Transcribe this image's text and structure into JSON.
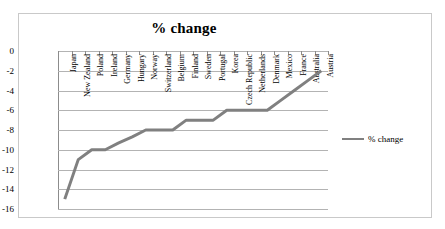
{
  "chart_data": {
    "type": "line",
    "title": "% change",
    "xlabel": "",
    "ylabel": "",
    "ylim": [
      -16,
      0
    ],
    "yticks": [
      0,
      -2,
      -4,
      -6,
      -8,
      -10,
      -12,
      -14,
      -16
    ],
    "ytick_labels": [
      "0",
      "-2",
      "-4",
      "-6",
      "-8",
      "-10",
      "-12",
      "-14",
      "-16"
    ],
    "grid": true,
    "legend_position": "right",
    "series_name": "% change",
    "series_color": "#808080",
    "categories": [
      "Japan",
      "New Zealand",
      "Poland",
      "Ireland",
      "Germany",
      "Hungary",
      "Norway",
      "Switzerland",
      "Belgium",
      "Finland",
      "Sweden",
      "Portugal",
      "Korea",
      "Czech Republic",
      "Netherlands",
      "Denmark",
      "Mexico",
      "France",
      "Australia",
      "Austria"
    ],
    "values": [
      -15.0,
      -11.0,
      -10.0,
      -10.0,
      -9.3,
      -8.7,
      -8.0,
      -8.0,
      -8.0,
      -7.0,
      -7.0,
      -7.0,
      -6.0,
      -6.0,
      -6.0,
      -6.0,
      -5.0,
      -4.0,
      -3.0,
      -2.0
    ],
    "series": [
      {
        "name": "% change",
        "values": [
          -15.0,
          -11.0,
          -10.0,
          -10.0,
          -9.3,
          -8.7,
          -8.0,
          -8.0,
          -8.0,
          -7.0,
          -7.0,
          -7.0,
          -6.0,
          -6.0,
          -6.0,
          -6.0,
          -5.0,
          -4.0,
          -3.0,
          -2.0
        ]
      }
    ]
  },
  "legend": {
    "label": "% change"
  }
}
